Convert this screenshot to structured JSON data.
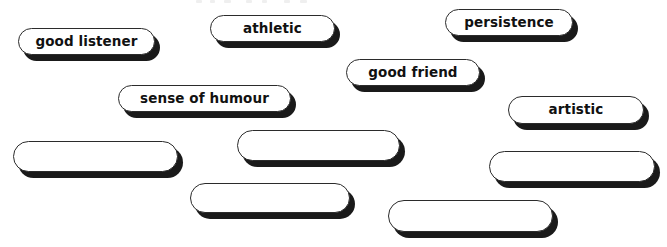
{
  "worksheet": {
    "background_color": "#ffffff",
    "pill_fill_color": "#ffffff",
    "pill_outline_color": "#2b2b2b",
    "pill_shadow_color": "#1a1a1a",
    "text_color": "#111111",
    "pills": [
      {
        "id": "good-listener",
        "label": "good listener",
        "blank": false,
        "x": 18,
        "y": 28,
        "w": 137,
        "h": 27
      },
      {
        "id": "athletic",
        "label": "athletic",
        "blank": false,
        "x": 210,
        "y": 15,
        "w": 125,
        "h": 27
      },
      {
        "id": "persistence",
        "label": "persistence",
        "blank": false,
        "x": 445,
        "y": 9,
        "w": 128,
        "h": 27
      },
      {
        "id": "good-friend",
        "label": "good friend",
        "blank": false,
        "x": 346,
        "y": 59,
        "w": 134,
        "h": 27
      },
      {
        "id": "sense-of-humour",
        "label": "sense of humour",
        "blank": false,
        "x": 118,
        "y": 85,
        "w": 173,
        "h": 27
      },
      {
        "id": "artistic",
        "label": "artistic",
        "blank": false,
        "x": 508,
        "y": 96,
        "w": 136,
        "h": 28
      },
      {
        "id": "blank-1",
        "label": "",
        "blank": true,
        "x": 13,
        "y": 141,
        "w": 165,
        "h": 31
      },
      {
        "id": "blank-2",
        "label": "",
        "blank": true,
        "x": 237,
        "y": 130,
        "w": 163,
        "h": 31
      },
      {
        "id": "blank-3",
        "label": "",
        "blank": true,
        "x": 489,
        "y": 151,
        "w": 166,
        "h": 31
      },
      {
        "id": "blank-4",
        "label": "",
        "blank": true,
        "x": 190,
        "y": 183,
        "w": 160,
        "h": 30
      },
      {
        "id": "blank-5",
        "label": "",
        "blank": true,
        "x": 388,
        "y": 200,
        "w": 165,
        "h": 32
      }
    ],
    "top_edge_artifacts": [
      {
        "x": 196,
        "w": 6
      },
      {
        "x": 210,
        "w": 5
      },
      {
        "x": 224,
        "w": 7
      },
      {
        "x": 246,
        "w": 6
      },
      {
        "x": 262,
        "w": 5
      },
      {
        "x": 284,
        "w": 6
      },
      {
        "x": 300,
        "w": 7
      }
    ]
  }
}
